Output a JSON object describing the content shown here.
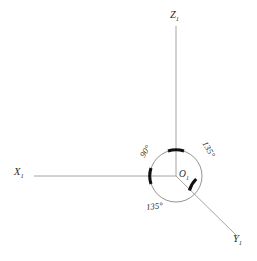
{
  "figure": {
    "type": "coordinate-axes-diagram",
    "background_color": "#ffffff",
    "axis_color": "#9a9a9a",
    "circle_color": "#777777",
    "arc_marker_color": "#111111",
    "text_color": "#2b2b2b"
  },
  "origin": {
    "name": "O",
    "subscript": "1",
    "label": "O",
    "x": 176,
    "y": 176
  },
  "axes": [
    {
      "id": "z-axis",
      "name": "Z",
      "subscript": "1",
      "label": "Z",
      "direction": "up",
      "angle_deg": 90,
      "start": [
        176,
        176
      ],
      "end": [
        176,
        26
      ]
    },
    {
      "id": "x-axis",
      "name": "X",
      "subscript": "1",
      "label": "X",
      "direction": "left",
      "angle_deg": 180,
      "start": [
        176,
        176
      ],
      "end": [
        34,
        176
      ]
    },
    {
      "id": "y-axis",
      "name": "Y",
      "subscript": "1",
      "label": "Y",
      "direction": "down-right",
      "angle_deg": -45,
      "start": [
        176,
        176
      ],
      "end": [
        237,
        236
      ]
    }
  ],
  "circle": {
    "center": [
      176,
      176
    ],
    "radius": 26
  },
  "angles": [
    {
      "id": "angle-x-z",
      "value": "90",
      "unit": "°",
      "label": "90°",
      "between": [
        "X1",
        "Z1"
      ],
      "quadrant": "upper-left",
      "rotation_deg": -57
    },
    {
      "id": "angle-z-y",
      "value": "135",
      "unit": "°",
      "label": "135°",
      "between": [
        "Z1",
        "Y1"
      ],
      "quadrant": "upper-right",
      "rotation_deg": 60
    },
    {
      "id": "angle-y-x",
      "value": "135",
      "unit": "°",
      "label": "135°",
      "between": [
        "Y1",
        "X1"
      ],
      "quadrant": "lower-left",
      "rotation_deg": -7
    }
  ],
  "arc_markers": [
    {
      "id": "marker-z",
      "at_axis": "Z1",
      "angle_deg": 90
    },
    {
      "id": "marker-x",
      "at_axis": "X1",
      "angle_deg": 180
    },
    {
      "id": "marker-y",
      "at_axis": "Y1",
      "angle_deg": -45
    }
  ]
}
